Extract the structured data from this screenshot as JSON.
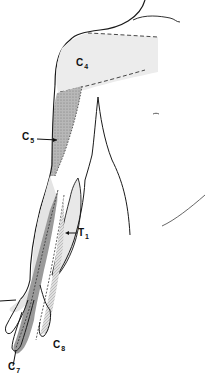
{
  "figure": {
    "labels": [
      {
        "id": "c4",
        "letter": "C",
        "sub": "4",
        "x": 76,
        "y": 58
      },
      {
        "id": "c5",
        "letter": "C",
        "sub": "5",
        "x": 22,
        "y": 132
      },
      {
        "id": "t1",
        "letter": "T",
        "sub": "1",
        "x": 78,
        "y": 228
      },
      {
        "id": "c8",
        "letter": "C",
        "sub": "8",
        "x": 53,
        "y": 340
      },
      {
        "id": "c7",
        "letter": "C",
        "sub": "7",
        "x": 8,
        "y": 362
      }
    ],
    "colors": {
      "outline": "#1a1a1a",
      "c4_fill": "#ececec",
      "c5_fill": "#a8a8a8",
      "c6_fill": "#e4e4e4",
      "c7_fill": "#9a9a9a",
      "c8_fill": "#cfcfcf",
      "t1_fill": "#e8e8e8"
    }
  }
}
